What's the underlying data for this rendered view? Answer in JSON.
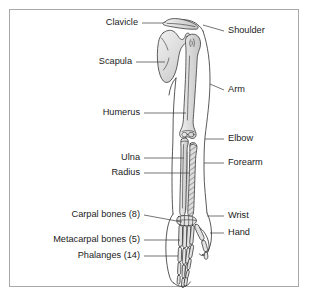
{
  "figure": {
    "border_color": "#a8a8a8",
    "background_color": "#ffffff",
    "bone_fill_color": "#d9d9d9",
    "outline_color": "#2e2e2e",
    "leader_color": "#3a3a3a",
    "text_color": "#1b1b1b"
  },
  "labels_left": [
    {
      "id": "clavicle",
      "text": "Clavicle",
      "text_x": 138,
      "text_y": 23,
      "leader": "M142,23 L163,23"
    },
    {
      "id": "scapula",
      "text": "Scapula",
      "text_x": 132,
      "text_y": 62,
      "leader": "M136,62 L165,62"
    },
    {
      "id": "humerus",
      "text": "Humerus",
      "text_x": 140,
      "text_y": 113,
      "leader": "M144,113 L186,113"
    },
    {
      "id": "ulna",
      "text": "Ulna",
      "text_x": 140,
      "text_y": 158,
      "leader": "M144,158 L184,158"
    },
    {
      "id": "radius",
      "text": "Radius",
      "text_x": 140,
      "text_y": 173,
      "leader": "M144,173 L190,173"
    },
    {
      "id": "carpals",
      "text": "Carpal bones (8)",
      "text_x": 140,
      "text_y": 215,
      "leader": "M144,215 L182,222"
    },
    {
      "id": "metacarpals",
      "text": "Metacarpal bones (5)",
      "text_x": 140,
      "text_y": 240,
      "leader": "M144,240 L180,240"
    },
    {
      "id": "phalanges",
      "text": "Phalanges (14)",
      "text_x": 140,
      "text_y": 256,
      "leader": "M144,256 L178,256"
    }
  ],
  "labels_right": [
    {
      "id": "shoulder",
      "text": "Shoulder",
      "text_x": 228,
      "text_y": 31,
      "leader": "M203,25 L224,31"
    },
    {
      "id": "arm",
      "text": "Arm",
      "text_x": 228,
      "text_y": 90,
      "leader": "M210,84 L224,90"
    },
    {
      "id": "elbow",
      "text": "Elbow",
      "text_x": 228,
      "text_y": 139,
      "leader": "M205,139 L224,139"
    },
    {
      "id": "forearm",
      "text": "Forearm",
      "text_x": 228,
      "text_y": 163,
      "leader": "M204,163 L224,163"
    },
    {
      "id": "wrist",
      "text": "Wrist",
      "text_x": 228,
      "text_y": 216,
      "leader": "M207,216 L224,216"
    },
    {
      "id": "hand",
      "text": "Hand",
      "text_x": 228,
      "text_y": 233,
      "leader": "M210,233 L224,233"
    }
  ]
}
